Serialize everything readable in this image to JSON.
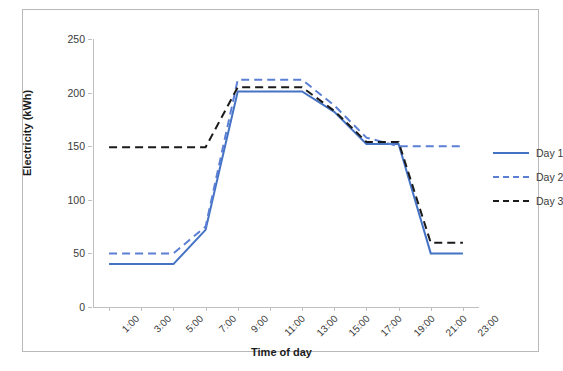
{
  "chart_data": {
    "type": "line",
    "title": "",
    "xlabel": "Time of day",
    "ylabel": "Electricity (kWh)",
    "x": [
      "1:00",
      "3:00",
      "5:00",
      "7:00",
      "9:00",
      "11:00",
      "13:00",
      "15:00",
      "17:00",
      "19:00",
      "21:00",
      "23:00"
    ],
    "xtick_labels": [
      "1:00",
      "3:00",
      "5:00",
      "7:00",
      "9:00",
      "11:00",
      "13:00",
      "15:00",
      "17:00",
      "19:00",
      "21:00",
      "23:00"
    ],
    "ytick_labels": [
      "0",
      "50",
      "100",
      "150",
      "200",
      "250"
    ],
    "yticks": [
      0,
      50,
      100,
      150,
      200,
      250
    ],
    "ylim": [
      0,
      250
    ],
    "grid": false,
    "legend_position": "right",
    "series": [
      {
        "name": "Day 1",
        "color": "#4472C4",
        "style": "solid",
        "values": [
          40,
          40,
          40,
          72,
          201,
          201,
          201,
          182,
          152,
          152,
          50,
          50
        ]
      },
      {
        "name": "Day 2",
        "color": "#5B7FD4",
        "style": "dashed",
        "values": [
          50,
          50,
          50,
          75,
          212,
          212,
          212,
          188,
          158,
          150,
          150,
          150
        ]
      },
      {
        "name": "Day 3",
        "color": "#1a1a1a",
        "style": "dashed",
        "values": [
          149,
          149,
          149,
          149,
          205,
          205,
          205,
          183,
          154,
          154,
          60,
          60
        ]
      }
    ]
  }
}
